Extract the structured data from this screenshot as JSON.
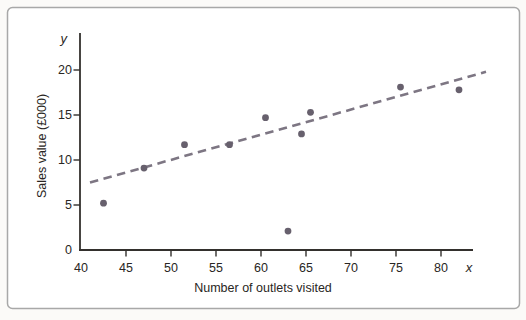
{
  "figure": {
    "background": "#ffffff",
    "border_color": "#a8a8a8"
  },
  "chart_data": {
    "type": "scatter",
    "title": "",
    "xlabel": "Number of outlets visited",
    "ylabel": "Sales value (£000)",
    "x_letter": "x",
    "y_letter": "y",
    "x_ticks": [
      40,
      45,
      50,
      55,
      60,
      65,
      70,
      75,
      80
    ],
    "y_ticks": [
      0,
      5,
      10,
      15,
      20
    ],
    "xlim": [
      40,
      83.5
    ],
    "ylim": [
      0,
      24
    ],
    "grid": false,
    "legend": false,
    "points": [
      {
        "x": 42.5,
        "y": 5.2
      },
      {
        "x": 47,
        "y": 9.1
      },
      {
        "x": 51.5,
        "y": 11.7
      },
      {
        "x": 56.5,
        "y": 11.7
      },
      {
        "x": 60.5,
        "y": 14.7
      },
      {
        "x": 63,
        "y": 2.1
      },
      {
        "x": 64.5,
        "y": 12.9
      },
      {
        "x": 65.5,
        "y": 15.3
      },
      {
        "x": 75.5,
        "y": 18.1
      },
      {
        "x": 82,
        "y": 17.8
      }
    ],
    "trendline": {
      "style": "dashed",
      "x1": 41,
      "y1": 7.5,
      "x2": 85,
      "y2": 19.8
    },
    "colors": {
      "point": "#67606d",
      "trend": "#7d7683",
      "axis": "#33302d",
      "text": "#292623"
    }
  }
}
